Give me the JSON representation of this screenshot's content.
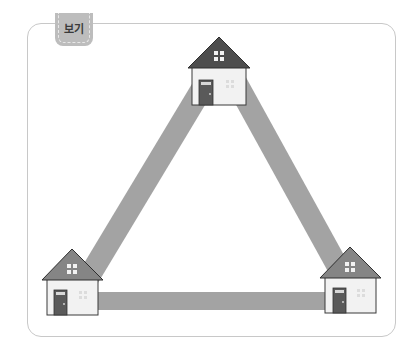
{
  "panel": {
    "tab_label": "보기"
  },
  "diagram": {
    "colors": {
      "road": "#a3a3a3",
      "roof_top_house": "#4d4d4d",
      "roof_bottom_houses": "#858585",
      "wall": "#f2f2f2",
      "door": "#5a5a5a",
      "outline": "#3a3a3a"
    },
    "houses": [
      {
        "id": "top",
        "icon": "house-icon"
      },
      {
        "id": "bottom-left",
        "icon": "house-icon"
      },
      {
        "id": "bottom-right",
        "icon": "house-icon"
      }
    ],
    "roads": [
      {
        "from": "top",
        "to": "bottom-left"
      },
      {
        "from": "top",
        "to": "bottom-right"
      },
      {
        "from": "bottom-left",
        "to": "bottom-right"
      }
    ]
  }
}
